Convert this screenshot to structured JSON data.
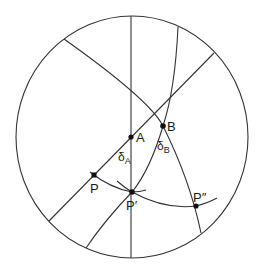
{
  "diagram": {
    "type": "stereonet",
    "stroke_color": "#333333",
    "points": [
      {
        "id": "A",
        "label": "A",
        "x": 131,
        "y": 137
      },
      {
        "id": "B",
        "label": "B",
        "x": 163,
        "y": 126
      },
      {
        "id": "P",
        "label": "P",
        "x": 94,
        "y": 175
      },
      {
        "id": "P1",
        "label": "P′",
        "x": 132,
        "y": 192
      },
      {
        "id": "P2",
        "label": "P″",
        "x": 196,
        "y": 206
      }
    ],
    "angle_labels": [
      {
        "id": "delta_A",
        "symbol": "δ",
        "subscript": "A"
      },
      {
        "id": "delta_B",
        "symbol": "δ",
        "subscript": "B"
      }
    ]
  }
}
